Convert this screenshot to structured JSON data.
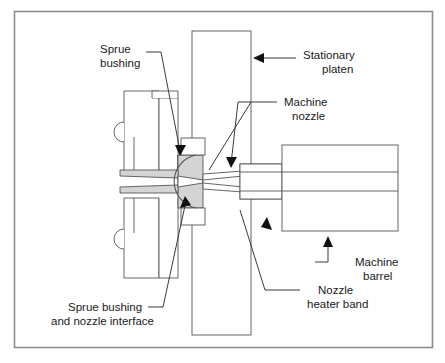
{
  "figure": {
    "border_color": "#888888",
    "background_color": "#ffffff",
    "line_color": "#555555",
    "shade_color": "#d4d4d4",
    "text_color": "#1a1a1a"
  },
  "labels": {
    "sprue_bushing": {
      "line1": "Sprue",
      "line2": "bushing"
    },
    "stationary_platen": {
      "line1": "Stationary",
      "line2": "platen"
    },
    "machine_nozzle": {
      "line1": "Machine",
      "line2": "nozzle"
    },
    "machine_barrel": {
      "line1": "Machine",
      "line2": "barrel"
    },
    "nozzle_heater_band": {
      "line1": "Nozzle",
      "line2": "heater band"
    },
    "sprue_bushing_interface": {
      "line1": "Sprue bushing",
      "line2": "and nozzle interface"
    }
  },
  "parts": [
    {
      "name": "stationary-platen",
      "shaded": false
    },
    {
      "name": "mold-plate-upper",
      "shaded": false
    },
    {
      "name": "mold-plate-lower",
      "shaded": false
    },
    {
      "name": "sprue-bushing",
      "shaded": true
    },
    {
      "name": "machine-nozzle",
      "shaded": false
    },
    {
      "name": "nozzle-heater-band",
      "shaded": false
    },
    {
      "name": "machine-barrel",
      "shaded": false
    },
    {
      "name": "sprue-channel",
      "shaded": true
    }
  ]
}
